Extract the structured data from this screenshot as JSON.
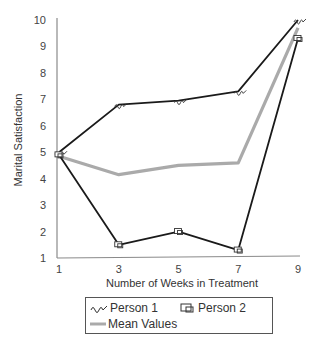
{
  "chart_data": {
    "type": "line",
    "title": "",
    "xlabel": "Number of Weeks in Treatment",
    "ylabel": "Marital Satisfaction",
    "x": [
      1,
      3,
      5,
      7,
      9
    ],
    "xticks": [
      "1",
      "3",
      "5",
      "7",
      "9"
    ],
    "yticks": [
      "1",
      "2",
      "3",
      "4",
      "5",
      "6",
      "7",
      "8",
      "9",
      "10"
    ],
    "xlim": [
      1,
      9
    ],
    "ylim": [
      1,
      10
    ],
    "grid": false,
    "legend_position": "bottom",
    "series": [
      {
        "name": "Person 1",
        "values": [
          5.0,
          6.8,
          6.95,
          7.3,
          10.0
        ],
        "color": "#1a1a1a",
        "marker": "squiggle"
      },
      {
        "name": "Person 2",
        "values": [
          4.9,
          1.5,
          2.0,
          1.3,
          9.3
        ],
        "color": "#1a1a1a",
        "marker": "box"
      },
      {
        "name": "Mean Values",
        "values": [
          4.85,
          4.15,
          4.5,
          4.6,
          9.7
        ],
        "color": "#aaaaaa",
        "marker": "none"
      }
    ]
  },
  "legend": {
    "person1": "Person 1",
    "person2": "Person 2",
    "mean": "Mean Values"
  }
}
